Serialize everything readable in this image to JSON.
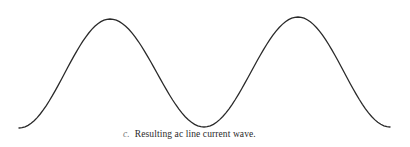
{
  "figure": {
    "caption_label": "c.",
    "caption_text": "Resulting ac line current wave.",
    "stroke_color": "#2a2a2a",
    "background": "#ffffff"
  },
  "chart_data": {
    "type": "line",
    "title": "Resulting ac line current wave.",
    "xlabel": "",
    "ylabel": "",
    "grid": false,
    "axes_visible": false,
    "series": [
      {
        "name": "ac line current",
        "shape": "sinusoid (two full cycles, starting and ending at trough)",
        "points_px": [
          [
            19,
            128
          ],
          [
            65,
            75
          ],
          [
            110,
            19
          ],
          [
            157,
            73
          ],
          [
            204,
            127
          ],
          [
            251,
            72
          ],
          [
            298,
            17
          ],
          [
            344,
            72
          ],
          [
            390,
            127
          ]
        ]
      }
    ]
  }
}
